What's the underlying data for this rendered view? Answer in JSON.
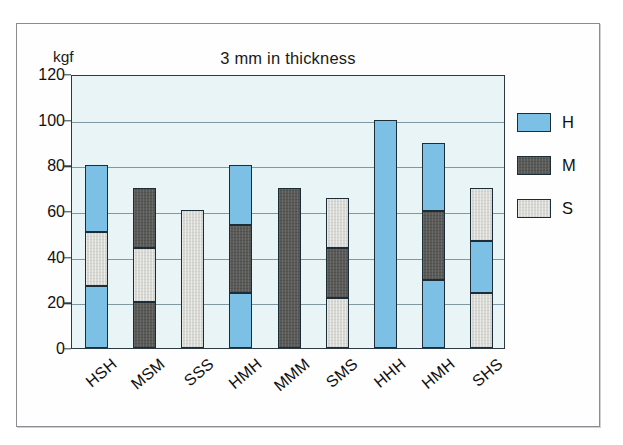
{
  "figure": {
    "unit_label": "kgf"
  },
  "legend": {
    "position": "right",
    "items": [
      {
        "label": "H",
        "color": "#7cc0e6",
        "name": "hard"
      },
      {
        "label": "M",
        "color": "#5a5a58",
        "name": "medium"
      },
      {
        "label": "S",
        "color": "#d8d8d4",
        "name": "soft"
      }
    ]
  },
  "chart_data": {
    "type": "bar",
    "subtype": "stacked-bar",
    "title": "3 mm in thickness",
    "xlabel": "",
    "ylabel": "kgf",
    "ylim": [
      0,
      120
    ],
    "ytick_step": 20,
    "yticks": [
      0,
      20,
      40,
      60,
      80,
      100,
      120
    ],
    "ytick_labels": [
      "0",
      "20",
      "40",
      "60",
      "80",
      "100",
      "120"
    ],
    "grid": true,
    "grid_axis": "y",
    "categories": [
      "HSH",
      "MSM",
      "SSS",
      "HMH",
      "MMM",
      "SMS",
      "HHH",
      "HMH",
      "SHS"
    ],
    "totals": [
      80,
      70,
      60.5,
      80,
      70,
      65.5,
      100,
      90,
      70
    ],
    "series": [
      {
        "name": "H",
        "color": "#7cc0e6",
        "values": [
          56,
          0,
          0,
          50,
          0,
          0,
          100,
          60,
          23
        ]
      },
      {
        "name": "M",
        "color": "#5a5a58",
        "values": [
          0,
          46,
          0,
          30,
          70,
          22,
          0,
          30,
          0
        ]
      },
      {
        "name": "S",
        "color": "#d8d8d4",
        "values": [
          24,
          24,
          60.5,
          0,
          0,
          43.5,
          0,
          0,
          47
        ]
      }
    ],
    "bars": [
      {
        "category": "HSH",
        "total": 80,
        "segments": [
          {
            "series": "H",
            "from": 0,
            "to": 27
          },
          {
            "series": "S",
            "from": 27,
            "to": 51
          },
          {
            "series": "H",
            "from": 51,
            "to": 80
          }
        ]
      },
      {
        "category": "MSM",
        "total": 70,
        "segments": [
          {
            "series": "M",
            "from": 0,
            "to": 20
          },
          {
            "series": "S",
            "from": 20,
            "to": 44
          },
          {
            "series": "M",
            "from": 44,
            "to": 70
          }
        ]
      },
      {
        "category": "SSS",
        "total": 60.5,
        "segments": [
          {
            "series": "S",
            "from": 0,
            "to": 60.5
          }
        ]
      },
      {
        "category": "HMH",
        "total": 80,
        "segments": [
          {
            "series": "H",
            "from": 0,
            "to": 24
          },
          {
            "series": "M",
            "from": 24,
            "to": 54
          },
          {
            "series": "H",
            "from": 54,
            "to": 80
          }
        ]
      },
      {
        "category": "MMM",
        "total": 70,
        "segments": [
          {
            "series": "M",
            "from": 0,
            "to": 70
          }
        ]
      },
      {
        "category": "SMS",
        "total": 65.5,
        "segments": [
          {
            "series": "S",
            "from": 0,
            "to": 22
          },
          {
            "series": "M",
            "from": 22,
            "to": 44
          },
          {
            "series": "S",
            "from": 44,
            "to": 65.5
          }
        ]
      },
      {
        "category": "HHH",
        "total": 100,
        "segments": [
          {
            "series": "H",
            "from": 0,
            "to": 100
          }
        ]
      },
      {
        "category": "HMH",
        "total": 90,
        "segments": [
          {
            "series": "H",
            "from": 0,
            "to": 30
          },
          {
            "series": "M",
            "from": 30,
            "to": 60
          },
          {
            "series": "H",
            "from": 60,
            "to": 90
          }
        ]
      },
      {
        "category": "SHS",
        "total": 70,
        "segments": [
          {
            "series": "S",
            "from": 0,
            "to": 24
          },
          {
            "series": "H",
            "from": 24,
            "to": 47
          },
          {
            "series": "S",
            "from": 47,
            "to": 70
          }
        ]
      }
    ]
  }
}
